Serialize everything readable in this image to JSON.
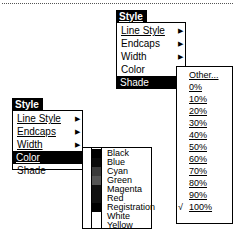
{
  "top_menu": {
    "header": "Style",
    "items": [
      {
        "label": "Line Style",
        "mnemonic": "L",
        "has_submenu": true
      },
      {
        "label": "Endcaps",
        "mnemonic": "E",
        "has_submenu": true
      },
      {
        "label": "Width",
        "mnemonic": "W",
        "has_submenu": true
      },
      {
        "label": "Color",
        "mnemonic": "C",
        "has_submenu": true
      },
      {
        "label": "Shade",
        "mnemonic": "d",
        "has_submenu": false,
        "selected": true
      }
    ],
    "shade_submenu": {
      "items": [
        {
          "label": "Other...",
          "checked": false
        },
        {
          "label": "0%",
          "checked": false
        },
        {
          "label": "10%",
          "checked": false
        },
        {
          "label": "20%",
          "checked": false
        },
        {
          "label": "30%",
          "checked": false
        },
        {
          "label": "40%",
          "checked": false
        },
        {
          "label": "50%",
          "checked": false
        },
        {
          "label": "60%",
          "checked": false
        },
        {
          "label": "70%",
          "checked": false
        },
        {
          "label": "80%",
          "checked": false
        },
        {
          "label": "90%",
          "checked": false
        },
        {
          "label": "100%",
          "checked": true
        }
      ],
      "check_mark": "√"
    }
  },
  "bottom_menu": {
    "header": "Style",
    "items": [
      {
        "label": "Line Style",
        "has_submenu": true
      },
      {
        "label": "Endcaps",
        "has_submenu": true
      },
      {
        "label": "Width",
        "has_submenu": true
      },
      {
        "label": "Color",
        "has_submenu": false,
        "selected": true,
        "check": "√"
      },
      {
        "label": "Shade",
        "has_submenu": false
      }
    ],
    "color_submenu": {
      "items": [
        {
          "label": "Black",
          "swatch": "#000000"
        },
        {
          "label": "Blue",
          "swatch": "#0a0a0a"
        },
        {
          "label": "Cyan",
          "swatch": "#3a3a3a"
        },
        {
          "label": "Green",
          "swatch": "#555555"
        },
        {
          "label": "Magenta",
          "swatch": "#111111"
        },
        {
          "label": "Red",
          "swatch": "#111111"
        },
        {
          "label": "Registration",
          "swatch": "#000000"
        },
        {
          "label": "White",
          "swatch": "#ffffff"
        },
        {
          "label": "Yellow",
          "swatch": "#ffffff"
        }
      ]
    }
  },
  "arrow_glyph": "▶"
}
